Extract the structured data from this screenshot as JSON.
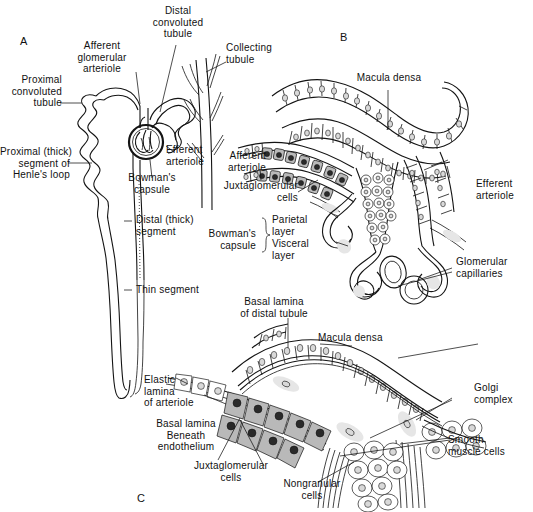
{
  "figure": {
    "ink_color": "#141414",
    "background_color": "#ffffff",
    "panels": [
      {
        "id": "A",
        "letter": "A",
        "caption": "Nephron overview"
      },
      {
        "id": "B",
        "letter": "B",
        "caption": "Juxtaglomerular apparatus, low magnification"
      },
      {
        "id": "C",
        "letter": "C",
        "caption": "Juxtaglomerular apparatus, high magnification"
      }
    ]
  },
  "panel_a": {
    "letter": "A",
    "labels": {
      "afferent_glomerular_arteriole": "Afferent\nglomerular\narteriole",
      "distal_convoluted_tubule": "Distal\nconvoluted\ntubule",
      "collecting_tubule": "Collecting\ntubule",
      "proximal_convoluted_tubule": "Proximal\nconvoluted\ntubule",
      "efferent_arteriole": "Efferent\narteriole",
      "bowmans_capsule": "Bowman's\ncapsule",
      "proximal_thick_segment": "Proximal (thick)\nsegment of\nHenle's loop",
      "distal_thick_segment": "Distal (thick)\nsegment",
      "thin_segment": "Thin segment"
    }
  },
  "panel_b": {
    "letter": "B",
    "labels": {
      "macula_densa": "Macula densa",
      "afferent_arteriole": "Afferent\narteriole",
      "juxtaglomerular_cells": "Juxtaglomerular\ncells",
      "bowmans_capsule": "Bowman's\ncapsule",
      "parietal_layer": "Parietal\nlayer",
      "visceral_layer": "Visceral\nlayer",
      "efferent_arteriole": "Efferent\narteriole",
      "glomerular_capillaries": "Glomerular\ncapillaries"
    }
  },
  "panel_c": {
    "letter": "C",
    "labels": {
      "basal_lamina_of_distal_tubule": "Basal lamina\nof distal tubule",
      "macula_densa": "Macula densa",
      "elastic_lamina_of_arteriole": "Elastic\nlamina\nof arteriole",
      "basal_lamina_beneath_endothelium": "Basal lamina\nBeneath\nendothelium",
      "juxtaglomerular_cells": "Juxtaglomerular\ncells",
      "nongranular_cells": "Nongranular\ncells",
      "golgi_complex": "Golgi\ncomplex",
      "smooth_muscle_cells": "Smooth\nmuscle cells"
    }
  }
}
